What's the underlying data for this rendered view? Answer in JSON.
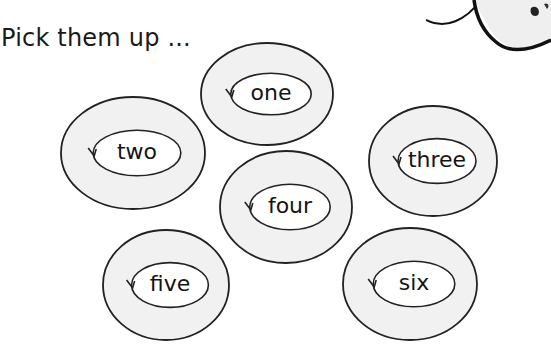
{
  "title": "Pick them up ...",
  "colors": {
    "ring_fill": "#f1f1f1",
    "inner_fill": "#ffffff",
    "stroke": "#222222"
  },
  "rings": [
    {
      "id": "one",
      "label": "one",
      "cx": 267,
      "cy": 94,
      "rx": 67,
      "ry": 52
    },
    {
      "id": "two",
      "label": "two",
      "cx": 133,
      "cy": 153,
      "rx": 73,
      "ry": 57
    },
    {
      "id": "three",
      "label": "three",
      "cx": 433,
      "cy": 161,
      "rx": 65,
      "ry": 56
    },
    {
      "id": "four",
      "label": "four",
      "cx": 286,
      "cy": 207,
      "rx": 67,
      "ry": 57
    },
    {
      "id": "five",
      "label": "five",
      "cx": 166,
      "cy": 285,
      "rx": 64,
      "ry": 56
    },
    {
      "id": "six",
      "label": "six",
      "cx": 410,
      "cy": 284,
      "rx": 68,
      "ry": 57
    }
  ]
}
